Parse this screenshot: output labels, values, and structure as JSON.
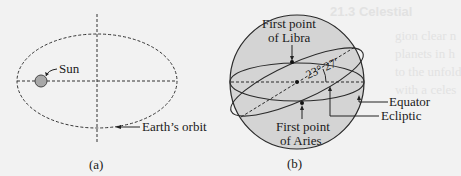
{
  "background_bleed": {
    "heading": "21.3  Celestial",
    "lines": [
      "gion clear n",
      "planets in h",
      "to the unfold",
      "with a celes",
      "the celestial",
      "Among them",
      "form equator",
      "Bodies as lying on the surface of a sphe"
    ]
  },
  "figure_a": {
    "caption": "(a)",
    "labels": {
      "sun": "Sun",
      "orbit": "Earth’s orbit"
    },
    "colors": {
      "sun_fill": "#a8a8a8",
      "line": "#333333"
    }
  },
  "figure_b": {
    "caption": "(b)",
    "labels": {
      "libra_line1": "First point",
      "libra_line2": "of Libra",
      "aries_line1": "First point",
      "aries_line2": "of Aries",
      "angle": "23° 27′",
      "equator": "Equator",
      "ecliptic": "Ecliptic"
    },
    "colors": {
      "sphere_fill": "#d4d4d4",
      "line": "#2a2a2a"
    }
  }
}
